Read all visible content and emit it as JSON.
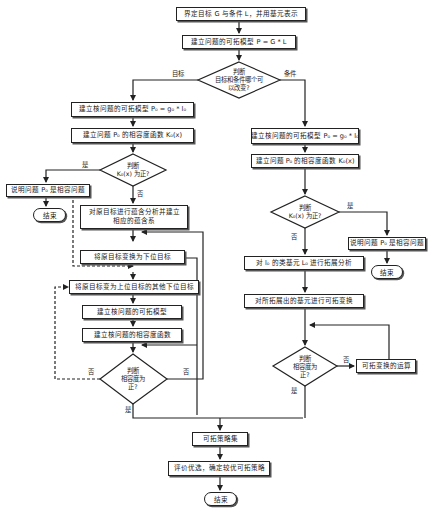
{
  "diagram": {
    "type": "flowchart",
    "nodes": {
      "start": "界定目标 G 与条件 L，并用基元表示",
      "model": "建立问题的可拓模型 P = G * L",
      "decide_main": [
        "判断",
        "目标和条件哪个可",
        "以改变?"
      ],
      "label_goal": "目标",
      "label_cond": "条件",
      "goal_model": "建立核问题的可拓模型 P₀ = g₀ * l₀",
      "goal_func": "建立问题 P₀ 的相容度函数 K₀(x)",
      "goal_decide": [
        "判断",
        "K₀(x) 为正?"
      ],
      "goal_yes": "是",
      "goal_no": "否",
      "goal_compat": "说明问题 P₀ 是相容问题",
      "goal_end": "结束",
      "implication": [
        "对原目标进行蕴含分析并建立",
        "相应的蕴含系"
      ],
      "lower_goal": "将原目标变换为下位目标",
      "other_lower": "将原目标变为上位目标的其他下位目标",
      "core_model": "建立核问题的可拓模型",
      "core_func": "建立核问题的相容度函数",
      "left_decide": [
        "判断",
        "相容度为",
        "正?"
      ],
      "left_no_a": "否",
      "left_no_b": "否",
      "left_yes": "是",
      "cond_model": "建立核问题的可拓模型 P₀ = g₀ * l₀",
      "cond_func": "建立问题 P₀ 的相容度函数 K₀(x)",
      "cond_decide": [
        "判断",
        "K₀(x) 为正?"
      ],
      "cond_yes": "是",
      "cond_no": "否",
      "cond_compat": "说明问题 P₀ 是相容问题",
      "cond_end": "结束",
      "extension": "对 l₀ 的类基元 L₀ 进行拓展分析",
      "transform": "对所拓展出的基元进行可拓变换",
      "right_decide": [
        "判断",
        "相容度为",
        "正?"
      ],
      "right_no": "否",
      "right_yes": "是",
      "operation": "可拓变换的运算",
      "strategy_set": "可拓策略集",
      "evaluate": "评价优选，确定较优可拓策略",
      "final_end": "结束"
    }
  },
  "colors": {
    "line": "#222222",
    "background": "#ffffff"
  }
}
